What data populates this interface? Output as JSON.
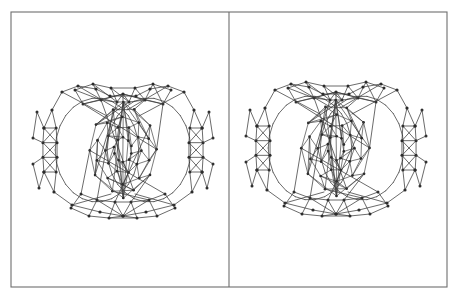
{
  "figure": {
    "kind": "stereo-pair-molecular-structure",
    "panel_count": 2,
    "caption": "",
    "labels": []
  },
  "style": {
    "background_color": "#ffffff",
    "frame_stroke_color": "#6e6e6e",
    "frame_stroke_width": 1.1,
    "bond_color": "#3a3a3a",
    "cage_bond_color": "#434343",
    "atom_color": "#2b2b2b",
    "bond_width": 0.75,
    "atom_radius": 1.5
  },
  "frame": {
    "left": 11,
    "top": 12,
    "right": 447,
    "bottom": 287,
    "divider_x": 229
  },
  "panels": [
    {
      "name": "left-eye-view",
      "offset_x": 0,
      "offset_y": 0,
      "center_x": 123,
      "center_y": 150
    },
    {
      "name": "right-eye-view",
      "offset_x": 213,
      "offset_y": -2,
      "center_x": 336,
      "center_y": 148
    }
  ],
  "structure": {
    "description": "Fullerene-like inner polyhedral cage enclosed by an outer metal-cluster shell with lateral cross-braced arms",
    "inner_cage": {
      "name": "fullerene-cage",
      "center_x": 123,
      "center_y": 150,
      "radius_x": 35,
      "radius_y": 44,
      "ring_counts": [
        10,
        10,
        10,
        10
      ],
      "ring_radii_x": [
        34,
        27,
        18,
        9
      ],
      "ring_radii_y": [
        43,
        34,
        23,
        12
      ],
      "ring_offsets_y": [
        0,
        0,
        0,
        0
      ],
      "ring_phase": [
        0,
        18,
        0,
        18
      ]
    },
    "outer_shell": {
      "name": "outer-cluster-shell",
      "center_x": 123,
      "center_y": 150,
      "loop_radius_x": 58,
      "loop_radius_y": 52
    },
    "arm_vertices": [
      [
        62,
        92
      ],
      [
        78,
        86
      ],
      [
        96,
        89
      ],
      [
        110,
        96
      ],
      [
        136,
        96
      ],
      [
        150,
        89
      ],
      [
        168,
        86
      ],
      [
        184,
        92
      ],
      [
        52,
        110
      ],
      [
        194,
        110
      ],
      [
        44,
        128
      ],
      [
        202,
        128
      ],
      [
        44,
        172
      ],
      [
        202,
        172
      ],
      [
        54,
        192
      ],
      [
        192,
        192
      ],
      [
        72,
        205
      ],
      [
        174,
        205
      ],
      [
        100,
        212
      ],
      [
        146,
        212
      ],
      [
        123,
        216
      ]
    ]
  }
}
